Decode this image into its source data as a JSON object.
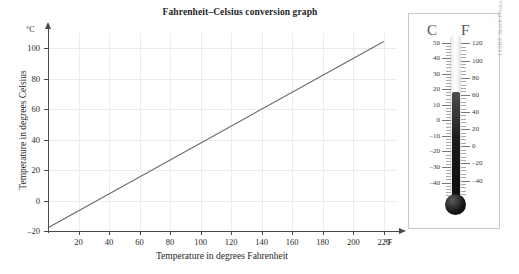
{
  "chart_data": {
    "type": "line",
    "title": "Fahrenheit–Celsius conversion graph",
    "xlabel": "Temperature in degrees Fahrenheit",
    "ylabel": "Temperature in degrees Celsius",
    "x_unit": "°F",
    "y_unit": "°C",
    "xlim": [
      0,
      228
    ],
    "ylim": [
      -20,
      110
    ],
    "xticks": [
      20,
      40,
      60,
      80,
      100,
      120,
      140,
      160,
      180,
      200,
      220
    ],
    "yticks": [
      -20,
      0,
      20,
      40,
      60,
      80,
      100
    ],
    "grid": true,
    "legend": "none",
    "series": [
      {
        "name": "F to C conversion",
        "color": "#6a6a6a",
        "x": [
          0,
          220
        ],
        "y": [
          -17.8,
          104.4
        ]
      }
    ],
    "annotation": "Straight line C = (F - 32) × 5/9 passing through (32, 0) and (212, 100)"
  },
  "photo": {
    "caption_credit": "123RF Stock Photo/Wolfgang Grossman Wolfgang",
    "thermometer": {
      "header_left": "C",
      "header_right": "F",
      "celsius_scale": [
        "50",
        "40",
        "30",
        "20",
        "10",
        "0",
        "-10",
        "-20",
        "-30",
        "-40"
      ],
      "fahrenheit_scale": [
        "120",
        "100",
        "80",
        "60",
        "40",
        "20",
        "0",
        "-20",
        "-40"
      ],
      "reading_celsius": "20",
      "reading_fahrenheit": "68"
    }
  }
}
